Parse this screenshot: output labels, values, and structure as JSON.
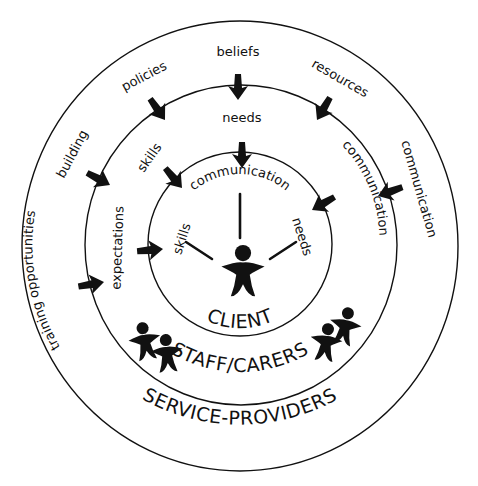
{
  "diagram": {
    "type": "concentric-circles",
    "center": {
      "x": 240,
      "y": 246
    },
    "rings": [
      {
        "id": "client",
        "label": "CLIENT",
        "radius": 92
      },
      {
        "id": "staff",
        "label": "STAFF/CARERS",
        "radius": 158
      },
      {
        "id": "service",
        "label": "SERVICE-PROVIDERS",
        "radius": 220
      }
    ],
    "client_ring": {
      "label": "CLIENT",
      "spokes": [
        "skills",
        "communication",
        "needs"
      ]
    },
    "staff_ring": {
      "label": "STAFF/CARERS",
      "inputs": [
        "expectations",
        "skills",
        "needs",
        "communication"
      ]
    },
    "service_ring": {
      "label": "SERVICE-PROVIDERS",
      "inputs": [
        "training opportunities",
        "building",
        "policies",
        "beliefs",
        "resources",
        "communication"
      ]
    },
    "colors": {
      "ink": "#111111",
      "background": "#ffffff"
    }
  },
  "labels": {
    "client": "CLIENT",
    "staff": "STAFF/CARERS",
    "service": "SERVICE-PROVIDERS",
    "inner_skills": "skills",
    "inner_communication": "communication",
    "inner_needs": "needs",
    "mid_expectations": "expectations",
    "mid_skills": "skills",
    "mid_needs": "needs",
    "mid_communication": "communication",
    "outer_training": "training opportunities",
    "outer_building": "building",
    "outer_policies": "policies",
    "outer_beliefs": "beliefs",
    "outer_resources": "resources",
    "outer_communication": "communication"
  }
}
